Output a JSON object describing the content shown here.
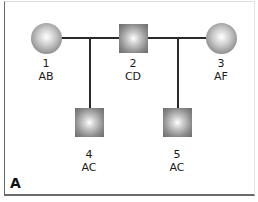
{
  "diagram": {
    "type": "pedigree",
    "panel_label": "A",
    "individuals": [
      {
        "id": "1",
        "genotype": "AB",
        "shape": "circle",
        "sex": "female",
        "generation": 1
      },
      {
        "id": "2",
        "genotype": "CD",
        "shape": "square",
        "sex": "male",
        "generation": 1
      },
      {
        "id": "3",
        "genotype": "AF",
        "shape": "circle",
        "sex": "female",
        "generation": 1
      },
      {
        "id": "4",
        "genotype": "AC",
        "shape": "square",
        "sex": "male",
        "generation": 2
      },
      {
        "id": "5",
        "genotype": "AC",
        "shape": "square",
        "sex": "male",
        "generation": 2
      }
    ],
    "relationships": [
      {
        "partners": [
          "1",
          "2"
        ],
        "children": [
          "4"
        ]
      },
      {
        "partners": [
          "2",
          "3"
        ],
        "children": [
          "5"
        ]
      }
    ],
    "colors": {
      "symbol_fill": "#8d8d8d",
      "line": "#2a2a2a",
      "frame": "#6a6a6a"
    }
  }
}
